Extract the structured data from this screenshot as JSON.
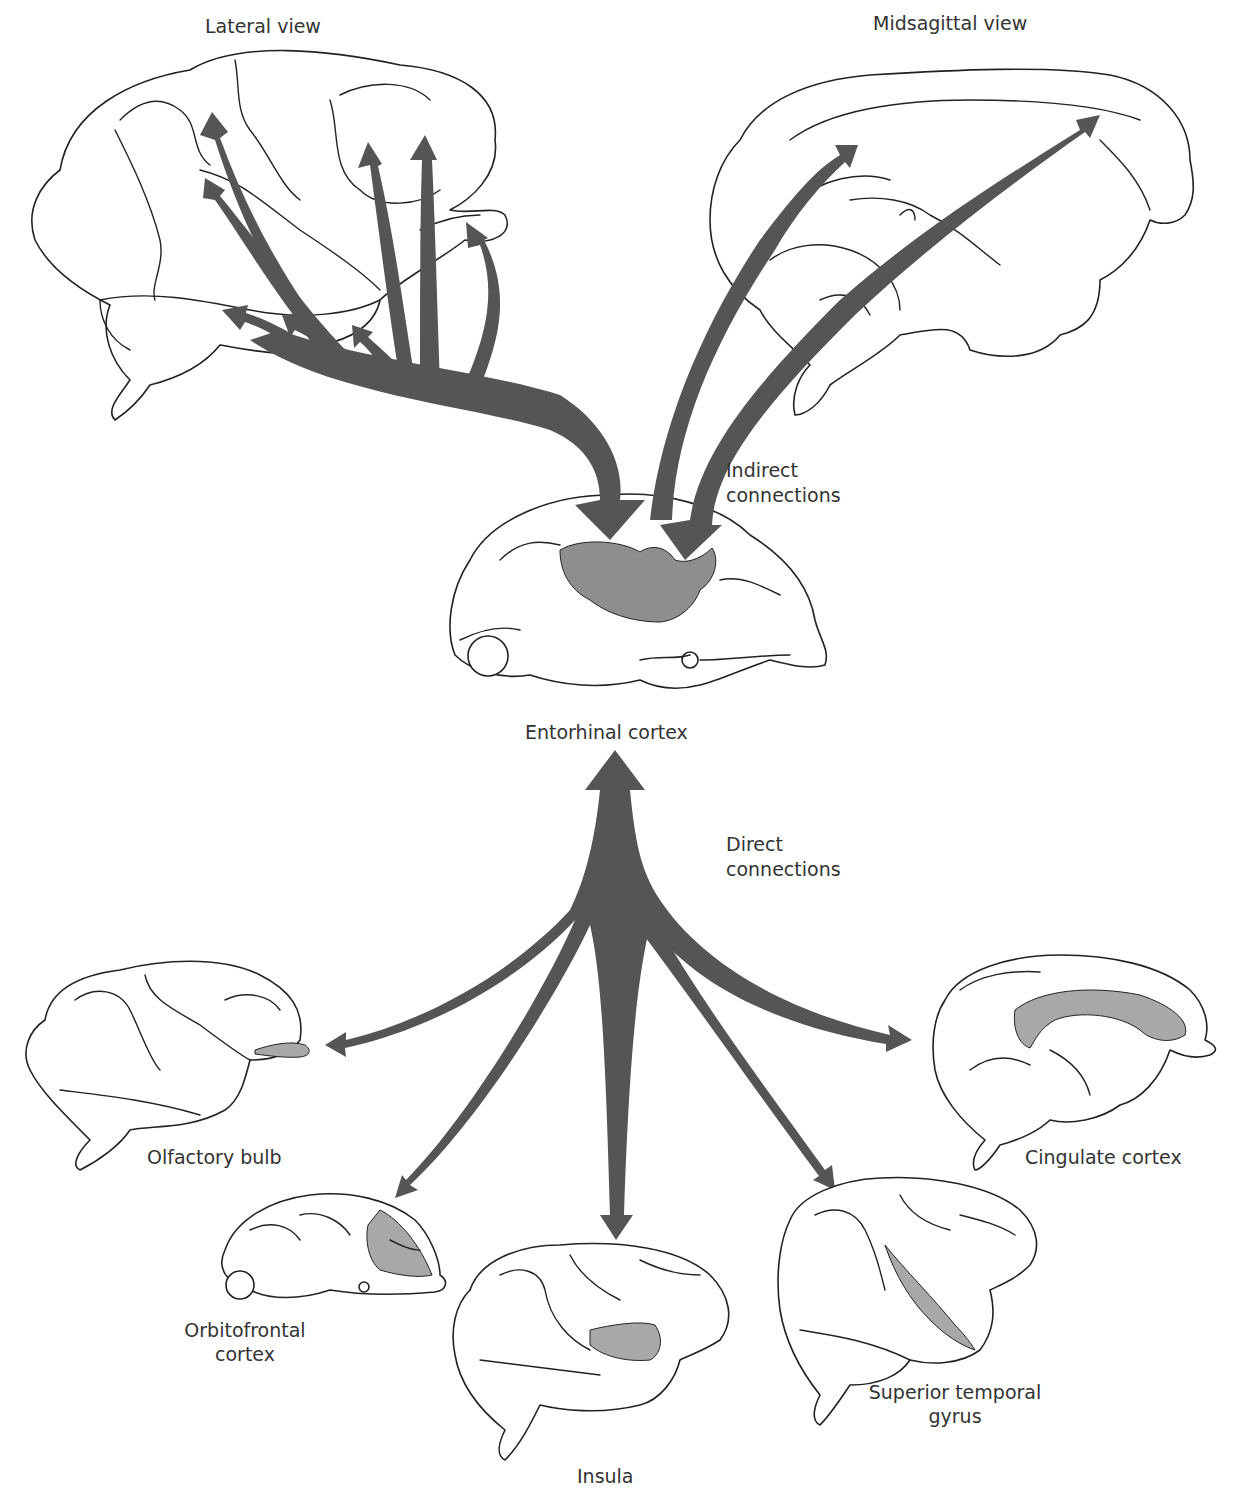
{
  "figure": {
    "colors": {
      "arrow": "#555555",
      "highlight": "#8e8e8e",
      "outline": "#222222",
      "background": "#ffffff"
    },
    "labels": {
      "lateral_view": "Lateral view",
      "midsagittal_view": "Midsagittal view",
      "indirect_line1": "Indirect",
      "indirect_line2": "connections",
      "entorhinal": "Entorhinal cortex",
      "direct_line1": "Direct",
      "direct_line2": "connections",
      "olfactory": "Olfactory bulb",
      "orbitofrontal_line1": "Orbitofrontal",
      "orbitofrontal_line2": "cortex",
      "insula": "Insula",
      "sup_temporal_line1": "Superior temporal",
      "sup_temporal_line2": "gyrus",
      "cingulate": "Cingulate cortex"
    },
    "sections": {
      "indirect": {
        "source_views": [
          "Lateral view",
          "Midsagittal view"
        ],
        "target": "Entorhinal cortex"
      },
      "direct": {
        "source": "Entorhinal cortex",
        "targets": [
          "Olfactory bulb",
          "Orbitofrontal cortex",
          "Insula",
          "Superior temporal gyrus",
          "Cingulate cortex"
        ]
      }
    }
  }
}
